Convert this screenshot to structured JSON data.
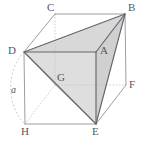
{
  "figure": {
    "type": "geometry-diagram",
    "canvas": {
      "width": 145,
      "height": 146
    },
    "background_color": "#ffffff",
    "stroke_color": "#8a8d91",
    "bold_stroke_color": "#5a5d61",
    "hidden_stroke_color": "#b9bcc0",
    "shade_light": "#dcdcdc",
    "shade_mid": "#d2d2d2",
    "shade_dark": "#c9c9c9",
    "label_color": "#55585c",
    "vertices": [
      {
        "name": "C",
        "x": 55,
        "y": 14,
        "label_x": 47,
        "label_y": 2,
        "hidden": false
      },
      {
        "name": "B",
        "x": 125,
        "y": 14,
        "label_x": 128,
        "label_y": 2,
        "hidden": false
      },
      {
        "name": "D",
        "x": 24,
        "y": 52,
        "label_x": 8,
        "label_y": 45,
        "hidden": false
      },
      {
        "name": "A",
        "x": 96,
        "y": 52,
        "label_x": 100,
        "label_y": 45,
        "hidden": false
      },
      {
        "name": "G",
        "x": 55,
        "y": 85,
        "label_x": 57,
        "label_y": 72,
        "hidden": true
      },
      {
        "name": "F",
        "x": 126,
        "y": 85,
        "label_x": 129,
        "label_y": 79,
        "hidden": false
      },
      {
        "name": "H",
        "x": 25,
        "y": 124,
        "label_x": 21,
        "label_y": 126,
        "hidden": false
      },
      {
        "name": "E",
        "x": 96,
        "y": 124,
        "label_x": 92,
        "label_y": 126,
        "hidden": false
      }
    ],
    "edge_labels": [
      {
        "name": "a",
        "text": "a",
        "x": 11,
        "y": 85,
        "measures": "D-H edge length"
      }
    ],
    "arc": {
      "from": "D",
      "to": "H",
      "style": "dashed",
      "label": "a"
    },
    "shaded_faces": [
      {
        "name": "face-DAB",
        "vertices": [
          "D",
          "A",
          "B"
        ]
      },
      {
        "name": "face-DAE",
        "vertices": [
          "D",
          "A",
          "E"
        ]
      },
      {
        "name": "face-ABE",
        "vertices": [
          "A",
          "B",
          "E"
        ]
      },
      {
        "name": "face-DGE",
        "vertices": [
          "D",
          "G",
          "E"
        ]
      }
    ],
    "solid_edges": [
      [
        "C",
        "B"
      ],
      [
        "C",
        "D"
      ],
      [
        "D",
        "A"
      ],
      [
        "A",
        "B"
      ],
      [
        "D",
        "H"
      ],
      [
        "A",
        "E"
      ],
      [
        "B",
        "F"
      ],
      [
        "H",
        "E"
      ],
      [
        "E",
        "F"
      ]
    ],
    "hidden_edges": [
      [
        "C",
        "G"
      ],
      [
        "G",
        "H"
      ],
      [
        "G",
        "F"
      ]
    ],
    "bold_edges": [
      [
        "D",
        "B"
      ],
      [
        "B",
        "E"
      ],
      [
        "D",
        "E"
      ],
      [
        "A",
        "B"
      ],
      [
        "A",
        "E"
      ],
      [
        "D",
        "A"
      ]
    ]
  }
}
